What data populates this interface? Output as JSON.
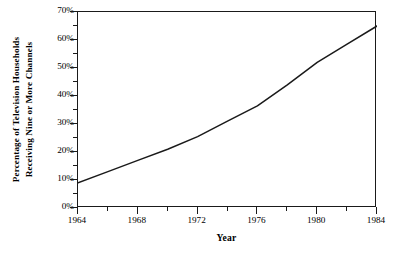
{
  "chart_data": {
    "type": "line",
    "title": "",
    "xlabel": "Year",
    "ylabel_line1": "Percentage of Television Households",
    "ylabel_line2": "Receiving Nine or More Channels",
    "xlim": [
      1964,
      1984
    ],
    "ylim": [
      0,
      70
    ],
    "grid": false,
    "legend": "none",
    "x_tick_labels": [
      "1964",
      "1968",
      "1972",
      "1976",
      "1980",
      "1984"
    ],
    "x_tick_values": [
      1964,
      1968,
      1972,
      1976,
      1980,
      1984
    ],
    "x_minor_tick_values": [
      1966,
      1970,
      1974,
      1978,
      1982
    ],
    "y_tick_labels": [
      "0%",
      "10%",
      "20%",
      "30%",
      "40%",
      "50%",
      "60%",
      "70%"
    ],
    "y_tick_values": [
      0,
      10,
      20,
      30,
      40,
      50,
      60,
      70
    ],
    "y_minor_tick_values": [
      5,
      15,
      25,
      35,
      45,
      55,
      65
    ],
    "series": [
      {
        "name": "Percentage of Television Households Receiving Nine or More Channels",
        "x": [
          1964,
          1966,
          1968,
          1970,
          1972,
          1974,
          1976,
          1978,
          1980,
          1982,
          1984
        ],
        "values": [
          9,
          13,
          17,
          21,
          25.5,
          31,
          36.5,
          44,
          52,
          58.5,
          65
        ],
        "color": "#1a1a1a"
      }
    ]
  },
  "axes": {
    "frame_color": "#1a1a1a"
  }
}
